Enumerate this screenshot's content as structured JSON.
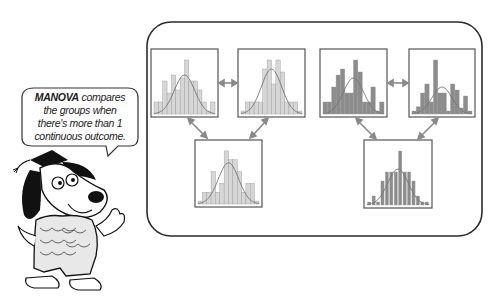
{
  "speech_bubble": {
    "bold_term": "MANOVA",
    "line1_rest": " compares",
    "line2": "the groups when",
    "line3": "there's more than 1",
    "line4": "continuous outcome."
  },
  "colors": {
    "frame": "#2b2b2b",
    "box_border": "#555555",
    "light_bar": "#d6d6d6",
    "dark_bar": "#8c8c8c",
    "curve": "#777777",
    "arrow": "#8a8a8a"
  },
  "histograms": [
    {
      "id": "top-left",
      "x": 151,
      "y": 49,
      "w": 67,
      "h": 68,
      "shade": "light",
      "bars": [
        0.2,
        0.2,
        0.55,
        0.35,
        0.65,
        0.4,
        0.6,
        0.9,
        0.55,
        0.55,
        0.4,
        0.2,
        0.05,
        0.2
      ],
      "curve_peak": 0.65
    },
    {
      "id": "top-mid-left",
      "x": 238,
      "y": 49,
      "w": 67,
      "h": 68,
      "shade": "light",
      "bars": [
        0.05,
        0.2,
        0.2,
        0.2,
        0.2,
        0.75,
        0.9,
        0.5,
        0.9,
        0.7,
        0.2,
        0.2,
        0.2,
        0.05
      ],
      "curve_peak": 0.75
    },
    {
      "id": "top-mid-right",
      "x": 320,
      "y": 49,
      "w": 67,
      "h": 68,
      "shade": "dark",
      "bars": [
        0.2,
        0.2,
        0.45,
        0.65,
        0.75,
        0.35,
        0.35,
        0.9,
        0.7,
        0.2,
        0.2,
        0.45,
        0.05,
        0.2
      ],
      "curve_peak": 0.6
    },
    {
      "id": "top-right",
      "x": 409,
      "y": 49,
      "w": 66,
      "h": 68,
      "shade": "dark",
      "bars": [
        0.05,
        0.12,
        0.35,
        0.5,
        0.2,
        0.9,
        0.35,
        0.35,
        0.05,
        0.5,
        0.4,
        0.1,
        0.3,
        0.05
      ],
      "curve_peak": 0.45
    },
    {
      "id": "bottom-left",
      "x": 195,
      "y": 140,
      "w": 67,
      "h": 67,
      "shade": "light",
      "bars": [
        0.05,
        0.2,
        0.2,
        0.55,
        0.2,
        0.35,
        0.9,
        0.75,
        0.75,
        0.55,
        0.2,
        0.35,
        0.35,
        0.05
      ],
      "curve_peak": 0.7
    },
    {
      "id": "bottom-right",
      "x": 364,
      "y": 140,
      "w": 68,
      "h": 68,
      "shade": "dark",
      "bars": [
        0.05,
        0.15,
        0.05,
        0.4,
        0.55,
        0.55,
        0.55,
        0.9,
        0.55,
        0.55,
        0.4,
        0.15,
        0.05,
        0.05
      ],
      "curve_peak": 0.6,
      "narrow": true
    }
  ],
  "main_frame": {
    "x": 147,
    "y": 22,
    "w": 335,
    "h": 214,
    "radius": 24
  }
}
